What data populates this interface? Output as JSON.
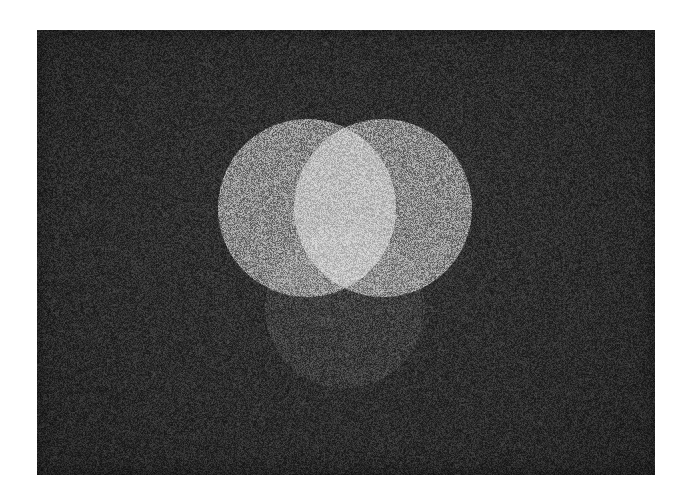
{
  "canvas": {
    "width": 689,
    "height": 498,
    "page_background": "#ffffff",
    "alt_text": "Three overlapping circles of light on a dark grainy background"
  },
  "plate": {
    "name": "dark-photographic-plate",
    "x": 37,
    "y": 30,
    "width": 618,
    "height": 445,
    "background_color": "#2b2b2b",
    "grain": "film-grain-noise"
  },
  "figure": {
    "type": "three-overlapping-circles",
    "blend_mode": "additive-light"
  },
  "circles": [
    {
      "id": "upper-left-circle",
      "label": "Upper left light circle",
      "cx": 307,
      "cy": 208,
      "r": 89,
      "color": "#6e6e6e",
      "relative_brightness": "bright"
    },
    {
      "id": "upper-right-circle",
      "label": "Upper right light circle",
      "cx": 383,
      "cy": 208,
      "r": 89,
      "color": "#6e6e6e",
      "relative_brightness": "bright"
    },
    {
      "id": "lower-center-circle",
      "label": "Lower center dim circle",
      "cx": 345,
      "cy": 308,
      "r": 80,
      "color": "#111111",
      "relative_brightness": "dim"
    }
  ],
  "measured_tones": {
    "background": "#2b2b2b",
    "single_bright_circle": "#9b9b9b",
    "bright_overlap_lens": "#f5f5f5",
    "dim_circle_alone": "#3a3a3a",
    "dim_overlap_with_bright": "#a4a4a4"
  },
  "overlaps": [
    {
      "id": "bright-lens",
      "label": "Bright central lens (upper left + upper right)",
      "tone": "#f5f5f5",
      "x_span": [
        303,
        388
      ],
      "top_y": 125,
      "bottom_y": 279
    },
    {
      "id": "lower-left-lune",
      "label": "Lower circle over upper left circle",
      "tone": "#a4a4a4"
    },
    {
      "id": "lower-right-lune",
      "label": "Lower circle over upper right circle",
      "tone": "#a4a4a4"
    }
  ]
}
